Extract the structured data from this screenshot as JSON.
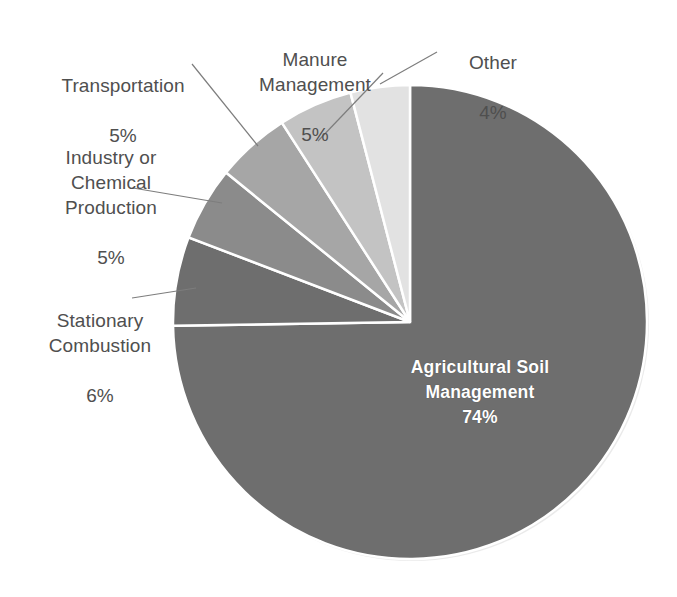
{
  "chart_data": {
    "type": "pie",
    "title": "",
    "subtitle": "",
    "xlabel": "",
    "ylabel": "",
    "legend_position": "none",
    "grid": false,
    "units": "percent",
    "start_angle_deg": 0,
    "direction": "clockwise",
    "categories": [
      "Agricultural Soil Management",
      "Stationary Combustion",
      "Industry or Chemical Production",
      "Transportation",
      "Manure Management",
      "Other"
    ],
    "values": [
      74,
      6,
      5,
      5,
      5,
      4
    ],
    "value_labels": [
      "74%",
      "6%",
      "5%",
      "5%",
      "5%",
      "4%"
    ],
    "colors": [
      "#6e6e6e",
      "#6e6e6e",
      "#8b8b8b",
      "#a6a6a6",
      "#c3c3c3",
      "#e2e2e2"
    ],
    "slice_border_color": "#ffffff",
    "slices": [
      {
        "name": "Agricultural Soil Management",
        "value": 74,
        "value_label": "74%",
        "color": "#6e6e6e",
        "label_placement": "inside",
        "label_color": "#ffffff"
      },
      {
        "name": "Stationary Combustion",
        "value": 6,
        "value_label": "6%",
        "color": "#6e6e6e",
        "label_placement": "outside-left",
        "label_color": "#4f4f4f"
      },
      {
        "name": "Industry or Chemical Production",
        "value": 5,
        "value_label": "5%",
        "color": "#8b8b8b",
        "label_placement": "outside-left",
        "label_color": "#4f4f4f"
      },
      {
        "name": "Transportation",
        "value": 5,
        "value_label": "5%",
        "color": "#a6a6a6",
        "label_placement": "outside-left",
        "label_color": "#4f4f4f"
      },
      {
        "name": "Manure Management",
        "value": 5,
        "value_label": "5%",
        "color": "#c3c3c3",
        "label_placement": "outside-top",
        "label_color": "#4f4f4f"
      },
      {
        "name": "Other",
        "value": 4,
        "value_label": "4%",
        "color": "#e2e2e2",
        "label_placement": "outside-top-right",
        "label_color": "#4f4f4f"
      }
    ]
  },
  "labels": {
    "agricultural": {
      "name": "Agricultural Soil\nManagement",
      "pct": "74%"
    },
    "stationary": {
      "name": "Stationary\nCombustion",
      "pct": "6%"
    },
    "industry": {
      "name": "Industry or\nChemical\nProduction",
      "pct": "5%"
    },
    "transportation": {
      "name": "Transportation",
      "pct": "5%"
    },
    "manure": {
      "name": "Manure\nManagement",
      "pct": "5%"
    },
    "other": {
      "name": "Other",
      "pct": "4%"
    }
  },
  "style": {
    "background": "#ffffff",
    "text_color": "#4f4f4f",
    "inside_text_color": "#ffffff",
    "leader_line_color": "#7d7d7d"
  }
}
